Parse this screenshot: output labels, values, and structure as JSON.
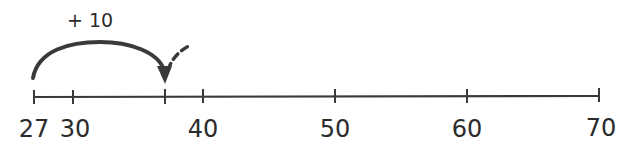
{
  "number_line": {
    "ticks": [
      {
        "value": 27,
        "label": "27",
        "x": 34
      },
      {
        "value": 30,
        "label": "30",
        "x": 73
      },
      {
        "value": 37,
        "label": "",
        "x": 165
      },
      {
        "value": 40,
        "label": "40",
        "x": 203
      },
      {
        "value": 50,
        "label": "50",
        "x": 335
      },
      {
        "value": 60,
        "label": "60",
        "x": 467
      },
      {
        "value": 70,
        "label": "70",
        "x": 599
      }
    ],
    "labels": {
      "t27": "27",
      "t30": "30",
      "t40": "40",
      "t50": "50",
      "t60": "60",
      "t70": "70"
    }
  },
  "jump": {
    "label": "+ 10",
    "from": 27,
    "to": 37
  },
  "colors": {
    "ink": "#3a3a3a"
  }
}
